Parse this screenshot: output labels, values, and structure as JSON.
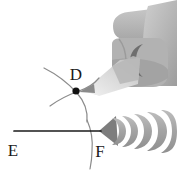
{
  "figure": {
    "background_color": "#ffffff",
    "ink_color": "#1a1a1a",
    "arc_color": "#8c8c8c",
    "labels": [
      {
        "id": "D",
        "text": "D",
        "x": 76,
        "y": 80,
        "role": "arc-intersection-point"
      },
      {
        "id": "E",
        "text": "E",
        "x": 13,
        "y": 156,
        "role": "ray-endpoint"
      },
      {
        "id": "F",
        "text": "F",
        "x": 100,
        "y": 157,
        "role": "vertex"
      }
    ],
    "points": [
      {
        "id": "D",
        "x": 76,
        "y": 91,
        "filled": true,
        "radius": 3.6
      }
    ],
    "segments": [
      {
        "id": "EF",
        "from": "E",
        "to": "F",
        "x1": 14,
        "y1": 131,
        "x2": 101,
        "y2": 131,
        "color": "#1a1a1a",
        "width": 1.6
      }
    ],
    "arcs": [
      {
        "id": "arc-left",
        "path": "M 44 68 C 56 74 68 83 77 93 C 85 102 88 112 87 122",
        "color": "#8c8c8c",
        "width": 1.2
      },
      {
        "id": "arc-right",
        "path": "M 50 106 C 58 100 68 95 79 91 C 88 88 94 84 99 78",
        "color": "#8c8c8c",
        "width": 1.2
      },
      {
        "id": "arc-through-F",
        "path": "M 88 120 C 91 128 93 140 92 152 C 92 158 91 163 90 168",
        "color": "#8c8c8c",
        "width": 1.2
      }
    ],
    "pencil": {
      "name": "pencil",
      "tip_x": 84,
      "tip_y": 90,
      "body_color": "#c9c9c9",
      "shadow_color": "#e2e2e2",
      "lead_color": "#9a9a9a"
    },
    "hand": {
      "name": "hand-holding-pencil",
      "skin_color": "#b4b4b4",
      "highlight_color": "#c9c9c9",
      "shadow_color": "#8f8f8f",
      "nail_color": "#6e6e6e"
    },
    "compass_tool": {
      "name": "compass-scalloped-ruler",
      "segment_count": 5,
      "body_color": "#a6a6a6",
      "edge_color": "#8a8a8a",
      "tip_color": "#7a7a7a"
    }
  }
}
